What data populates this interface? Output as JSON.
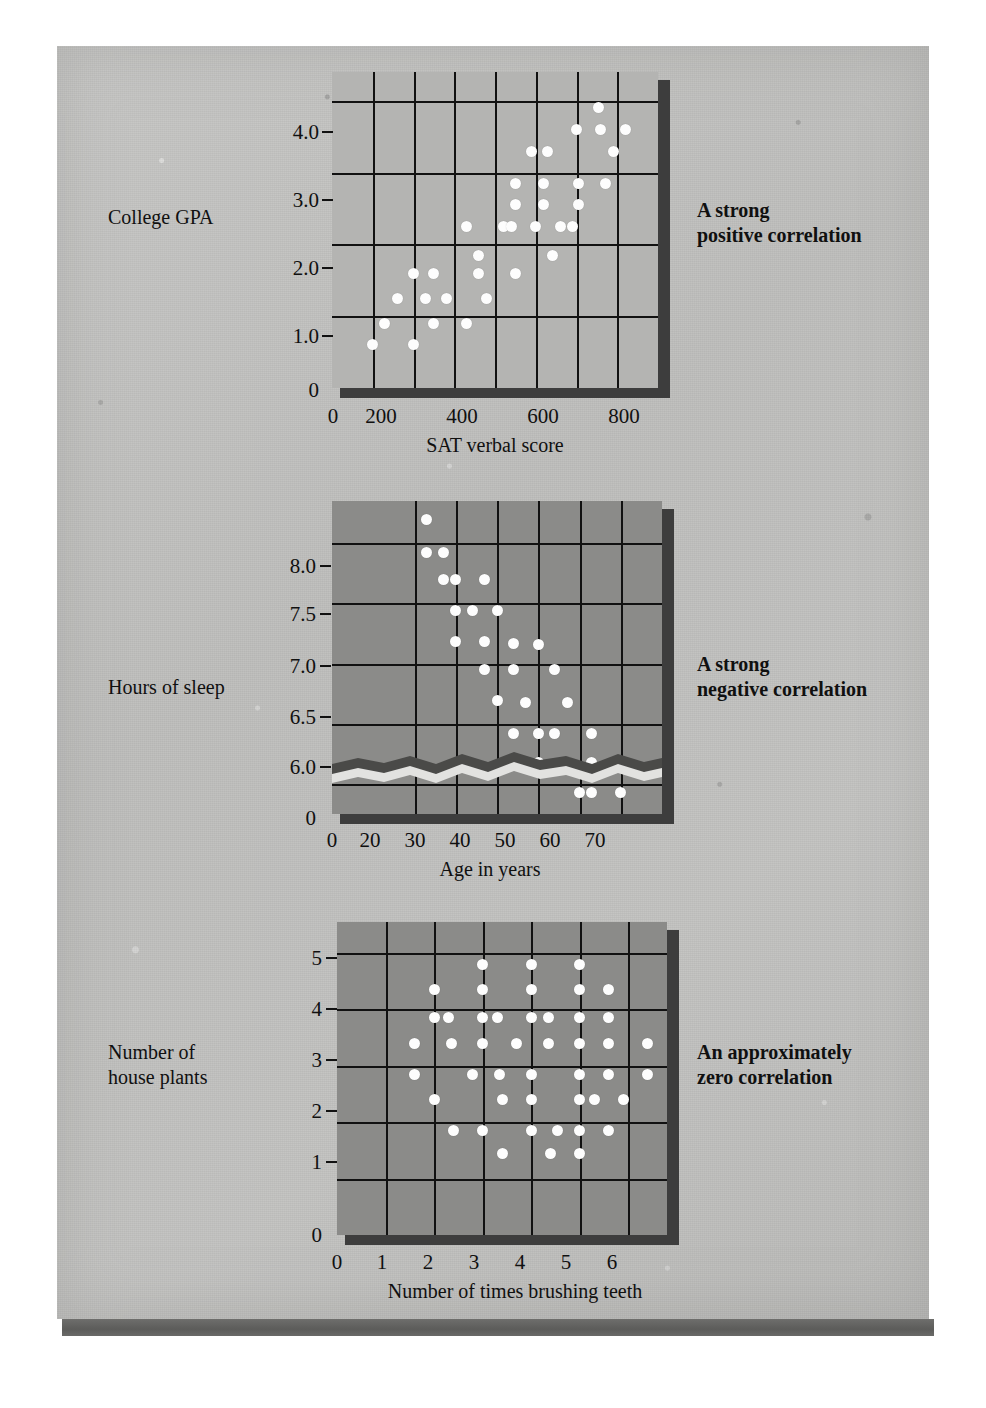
{
  "figure": {
    "background_color": "#c0c0be",
    "dot_color": "#fdfdfd",
    "grid_color": "#111111",
    "shadow_color": "#3d3d3d"
  },
  "panels": [
    {
      "id": "positive",
      "left_label": "College GPA",
      "right_label_line1": "A strong",
      "right_label_line2": "positive correlation",
      "plot_fill": "#b4b4b2",
      "chart_data": {
        "type": "scatter",
        "title": "",
        "xlabel": "SAT verbal score",
        "ylabel": "College GPA",
        "xlim": [
          100,
          900
        ],
        "ylim": [
          0,
          4.4
        ],
        "xticks": [
          "0",
          "200",
          "400",
          "600",
          "800"
        ],
        "xtick_values": [
          0,
          200,
          400,
          600,
          800
        ],
        "yticks": [
          "0",
          "1.0",
          "2.0",
          "3.0",
          "4.0"
        ],
        "ytick_values": [
          0,
          1.0,
          2.0,
          3.0,
          4.0
        ],
        "grid": true,
        "legend": "none",
        "points": [
          [
            200,
            0.6
          ],
          [
            230,
            0.9
          ],
          [
            260,
            1.25
          ],
          [
            300,
            1.6
          ],
          [
            300,
            0.6
          ],
          [
            330,
            1.25
          ],
          [
            350,
            1.6
          ],
          [
            350,
            0.9
          ],
          [
            380,
            1.25
          ],
          [
            430,
            2.25
          ],
          [
            430,
            0.9
          ],
          [
            460,
            1.85
          ],
          [
            460,
            1.6
          ],
          [
            480,
            1.25
          ],
          [
            520,
            2.25
          ],
          [
            540,
            2.25
          ],
          [
            550,
            2.85
          ],
          [
            550,
            2.55
          ],
          [
            550,
            1.6
          ],
          [
            590,
            3.3
          ],
          [
            600,
            2.25
          ],
          [
            620,
            2.85
          ],
          [
            620,
            2.55
          ],
          [
            630,
            3.3
          ],
          [
            640,
            1.85
          ],
          [
            660,
            2.25
          ],
          [
            690,
            2.25
          ],
          [
            700,
            3.6
          ],
          [
            705,
            2.85
          ],
          [
            705,
            2.55
          ],
          [
            755,
            3.9
          ],
          [
            760,
            3.6
          ],
          [
            770,
            2.85
          ],
          [
            790,
            3.3
          ],
          [
            820,
            3.6
          ]
        ]
      }
    },
    {
      "id": "negative",
      "left_label": "Hours of sleep",
      "right_label_line1": "A strong",
      "right_label_line2": "negative correlation",
      "plot_fill": "#8b8b89",
      "axis_break": true,
      "chart_data": {
        "type": "scatter",
        "title": "",
        "xlabel": "Age in years",
        "ylabel": "Hours of sleep",
        "xlim": [
          0,
          80
        ],
        "ylim": [
          5.75,
          8.35
        ],
        "xticks": [
          "0",
          "20",
          "30",
          "40",
          "50",
          "60",
          "70"
        ],
        "xtick_values": [
          0,
          20,
          30,
          40,
          50,
          60,
          70
        ],
        "yticks": [
          "0",
          "6.0",
          "6.5",
          "7.0",
          "7.5",
          "8.0"
        ],
        "ytick_values": [
          0,
          6.0,
          6.5,
          7.0,
          7.5,
          8.0
        ],
        "grid": true,
        "legend": "none",
        "points": [
          [
            23,
            8.2
          ],
          [
            23,
            7.92
          ],
          [
            27,
            7.92
          ],
          [
            27,
            7.7
          ],
          [
            30,
            7.7
          ],
          [
            30,
            7.44
          ],
          [
            30,
            7.18
          ],
          [
            34,
            7.44
          ],
          [
            37,
            7.7
          ],
          [
            37,
            7.18
          ],
          [
            37,
            6.95
          ],
          [
            40,
            7.44
          ],
          [
            40,
            6.69
          ],
          [
            44,
            7.17
          ],
          [
            44,
            6.95
          ],
          [
            44,
            6.42
          ],
          [
            47,
            6.68
          ],
          [
            50,
            7.16
          ],
          [
            50,
            6.42
          ],
          [
            50,
            6.18
          ],
          [
            54,
            6.95
          ],
          [
            54,
            6.42
          ],
          [
            57,
            6.68
          ],
          [
            57,
            6.18
          ],
          [
            60,
            5.93
          ],
          [
            63,
            6.42
          ],
          [
            63,
            6.18
          ],
          [
            63,
            5.93
          ],
          [
            70,
            5.93
          ]
        ]
      }
    },
    {
      "id": "zero",
      "left_label_line1": "Number of",
      "left_label_line2": "house plants",
      "right_label_line1": "An approximately",
      "right_label_line2": "zero correlation",
      "plot_fill": "#8b8b89",
      "chart_data": {
        "type": "scatter",
        "title": "",
        "xlabel": "Number of times brushing teeth",
        "ylabel": "Number of house plants",
        "xlim": [
          0,
          6.8
        ],
        "ylim": [
          0,
          5.55
        ],
        "xticks": [
          "0",
          "1",
          "2",
          "3",
          "4",
          "5",
          "6"
        ],
        "xtick_values": [
          0,
          1,
          2,
          3,
          4,
          5,
          6
        ],
        "yticks": [
          "0",
          "1",
          "2",
          "3",
          "4",
          "5"
        ],
        "ytick_values": [
          0,
          1,
          2,
          3,
          4,
          5
        ],
        "grid": true,
        "legend": "none",
        "points": [
          [
            1.6,
            3.4
          ],
          [
            1.6,
            2.85
          ],
          [
            2.0,
            4.35
          ],
          [
            2.0,
            3.85
          ],
          [
            2.0,
            2.4
          ],
          [
            2.3,
            3.85
          ],
          [
            2.35,
            3.4
          ],
          [
            2.4,
            1.85
          ],
          [
            3.0,
            4.8
          ],
          [
            3.0,
            4.35
          ],
          [
            3.0,
            3.85
          ],
          [
            3.0,
            3.4
          ],
          [
            3.0,
            1.85
          ],
          [
            2.8,
            2.85
          ],
          [
            3.3,
            3.85
          ],
          [
            3.35,
            2.85
          ],
          [
            3.4,
            2.4
          ],
          [
            3.4,
            1.45
          ],
          [
            3.7,
            3.4
          ],
          [
            4.0,
            4.8
          ],
          [
            4.0,
            4.35
          ],
          [
            4.0,
            3.85
          ],
          [
            4.0,
            2.85
          ],
          [
            4.0,
            2.4
          ],
          [
            4.0,
            1.85
          ],
          [
            4.35,
            3.85
          ],
          [
            4.35,
            3.4
          ],
          [
            4.4,
            1.45
          ],
          [
            4.55,
            1.85
          ],
          [
            5.0,
            4.8
          ],
          [
            5.0,
            4.35
          ],
          [
            5.0,
            3.85
          ],
          [
            5.0,
            3.4
          ],
          [
            5.0,
            2.85
          ],
          [
            5.0,
            2.4
          ],
          [
            5.0,
            1.85
          ],
          [
            5.0,
            1.45
          ],
          [
            5.3,
            2.4
          ],
          [
            5.6,
            4.35
          ],
          [
            5.6,
            3.85
          ],
          [
            5.6,
            3.4
          ],
          [
            5.6,
            2.85
          ],
          [
            5.6,
            1.85
          ],
          [
            5.9,
            2.4
          ],
          [
            6.4,
            3.4
          ],
          [
            6.4,
            2.85
          ]
        ]
      }
    }
  ]
}
